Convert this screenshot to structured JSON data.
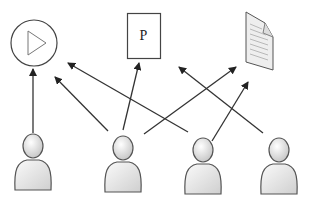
{
  "diagram": {
    "resources": [
      {
        "id": "video",
        "icon": "play-circle-icon"
      },
      {
        "id": "presentation",
        "icon": "p-document-icon",
        "label": "P"
      },
      {
        "id": "document",
        "icon": "text-document-icon"
      }
    ],
    "users": [
      {
        "id": "user-1",
        "icon": "user-icon"
      },
      {
        "id": "user-2",
        "icon": "user-icon"
      },
      {
        "id": "user-3",
        "icon": "user-icon"
      },
      {
        "id": "user-4",
        "icon": "user-icon"
      }
    ],
    "edges": [
      {
        "from": "user-1",
        "to": "video"
      },
      {
        "from": "user-2",
        "to": "video"
      },
      {
        "from": "user-2",
        "to": "presentation"
      },
      {
        "from": "user-2",
        "to": "document"
      },
      {
        "from": "user-3",
        "to": "video"
      },
      {
        "from": "user-3",
        "to": "document"
      },
      {
        "from": "user-4",
        "to": "presentation"
      }
    ],
    "colors": {
      "line": "#333333",
      "person_fill": "#e6e6e6",
      "person_stroke": "#555555"
    }
  }
}
